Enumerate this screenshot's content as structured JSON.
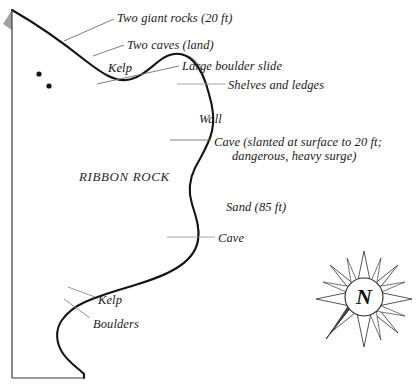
{
  "map": {
    "title": "RIBBON ROCK",
    "area_label": "RIBBON ROCK",
    "compass": {
      "north_letter": "N",
      "name": "compass-rose"
    },
    "colors": {
      "shoreline": "#1a1a1a",
      "kelp_band": "#6e6e6e",
      "outer_band": "#9a9a9a",
      "label_text": "#1a1a1a",
      "leader_line": "#7a7a7a",
      "background": "#ffffff"
    },
    "labels": [
      {
        "id": "two-giant-rocks",
        "text": "Two giant rocks (20 ft)",
        "x": 117,
        "y": 11
      },
      {
        "id": "two-caves-land",
        "text": "Two caves (land)",
        "x": 127,
        "y": 38
      },
      {
        "id": "kelp-upper",
        "text": "Kelp",
        "x": 108,
        "y": 61
      },
      {
        "id": "large-boulder-slide",
        "text": "Large boulder slide",
        "x": 182,
        "y": 59
      },
      {
        "id": "shelves-and-ledges",
        "text": "Shelves and ledges",
        "x": 228,
        "y": 78
      },
      {
        "id": "wall",
        "text": "Wall",
        "x": 199,
        "y": 112
      },
      {
        "id": "cave-slanted-line1",
        "text": "Cave (slanted at surface to 20 ft;",
        "x": 214,
        "y": 135
      },
      {
        "id": "cave-slanted-line2",
        "text": "dangerous, heavy surge)",
        "x": 232,
        "y": 149
      },
      {
        "id": "ribbon-rock",
        "text": "RIBBON ROCK",
        "x": 79,
        "y": 169
      },
      {
        "id": "sand-85ft",
        "text": "Sand (85 ft)",
        "x": 226,
        "y": 200
      },
      {
        "id": "cave-lower",
        "text": "Cave",
        "x": 218,
        "y": 231
      },
      {
        "id": "kelp-lower",
        "text": "Kelp",
        "x": 98,
        "y": 293
      },
      {
        "id": "boulders",
        "text": "Boulders",
        "x": 93,
        "y": 317
      }
    ],
    "features": [
      {
        "id": "rock-dot-1",
        "type": "rock-marker",
        "x": 39,
        "y": 74
      },
      {
        "id": "rock-dot-2",
        "type": "rock-marker",
        "x": 49,
        "y": 86
      }
    ]
  }
}
